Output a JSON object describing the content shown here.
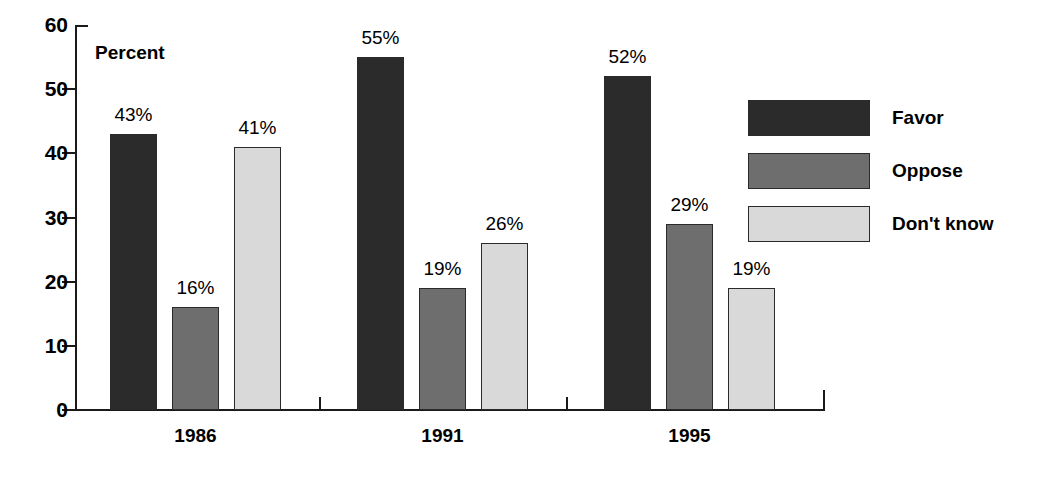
{
  "chart_data": {
    "type": "bar",
    "title": "",
    "xlabel": "",
    "ylabel": "Percent",
    "ylim": [
      0,
      60
    ],
    "yticks": [
      0,
      10,
      20,
      30,
      40,
      50,
      60
    ],
    "grid": false,
    "legend_position": "right",
    "categories": [
      "1986",
      "1991",
      "1995"
    ],
    "series": [
      {
        "name": "Favor",
        "color": "#2b2b2b",
        "values": [
          43,
          55,
          52
        ],
        "labels": [
          "43%",
          "55%",
          "52%"
        ]
      },
      {
        "name": "Oppose",
        "color": "#6e6e6e",
        "values": [
          16,
          19,
          29
        ],
        "labels": [
          "16%",
          "19%",
          "29%"
        ]
      },
      {
        "name": "Don't know",
        "color": "#d9d9d9",
        "values": [
          41,
          26,
          19
        ],
        "labels": [
          "41%",
          "26%",
          "19%"
        ]
      }
    ]
  },
  "axis": {
    "tick_labels": [
      "60",
      "50",
      "40",
      "30",
      "20",
      "10",
      "0"
    ],
    "title": "Percent"
  },
  "legend": {
    "items": [
      {
        "label": "Favor",
        "color": "#2b2b2b"
      },
      {
        "label": "Oppose",
        "color": "#6e6e6e"
      },
      {
        "label": "Don't know",
        "color": "#d9d9d9"
      }
    ]
  }
}
